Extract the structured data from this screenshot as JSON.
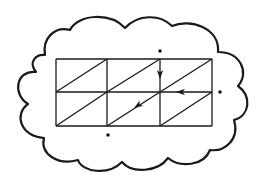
{
  "diagram": {
    "stroke_color": "#1a1a1a",
    "background_color": "#ffffff",
    "cloud": {
      "path": "M 45 55 C 42 38, 55 26, 70 30 C 78 14, 110 12, 125 28 C 138 14, 160 14, 172 26 C 190 18, 220 28, 218 52 C 240 52, 250 72, 238 86 C 252 96, 250 116, 234 120 C 240 140, 224 152, 210 150 C 204 166, 180 168, 168 158 C 158 172, 132 174, 122 162 C 108 176, 82 172, 78 160 C 58 166, 40 154, 44 138 C 20 136, 14 114, 28 104 C 12 94, 16 70, 36 72 C 28 62, 36 54, 45 55 Z"
    },
    "grid": {
      "x": [
        56,
        107,
        160,
        212
      ],
      "y": [
        59,
        92,
        126
      ],
      "cols": 3,
      "rows": 2,
      "diagonals": "bottom-left to top-right in every cell"
    },
    "arrows": [
      {
        "id": "down-arrow",
        "x": 160,
        "y": 79,
        "direction": "down"
      },
      {
        "id": "left-arrow",
        "x": 176,
        "y": 92,
        "direction": "left"
      },
      {
        "id": "diagonal-arrow",
        "x": 134,
        "y": 108,
        "direction": "down-left"
      }
    ],
    "dots": [
      {
        "id": "top-dot",
        "x": 160,
        "y": 51
      },
      {
        "id": "right-dot",
        "x": 220,
        "y": 92
      },
      {
        "id": "bottom-dot",
        "x": 108,
        "y": 135
      }
    ]
  }
}
